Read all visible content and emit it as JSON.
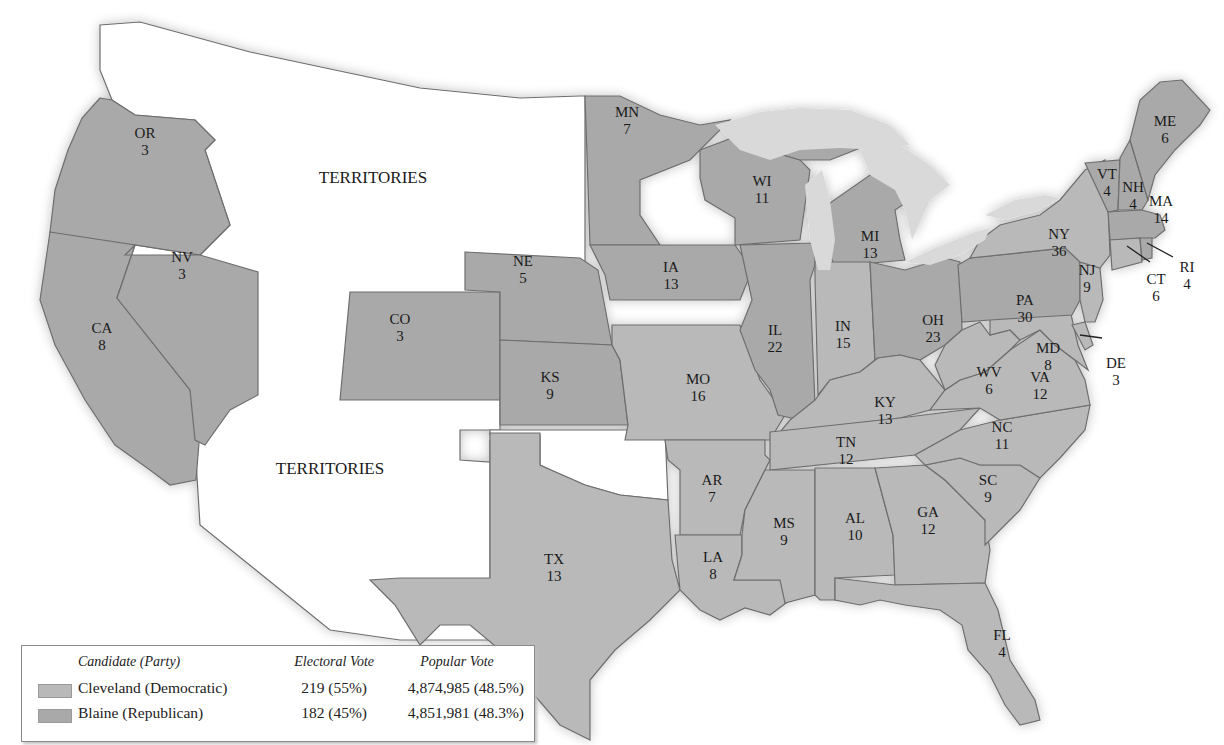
{
  "map": {
    "title": "Election of 1884",
    "territory_labels": [
      "TERRITORIES",
      "TERRITORIES"
    ],
    "colors": {
      "democratic": "#b9b9b9",
      "republican": "#a9a9a9",
      "territory": "#ffffff",
      "lakes": "#d9d9d9",
      "border": "#6e6e6e"
    },
    "states": [
      {
        "abbr": "OR",
        "ev": "3",
        "party": "republican"
      },
      {
        "abbr": "CA",
        "ev": "8",
        "party": "republican"
      },
      {
        "abbr": "NV",
        "ev": "3",
        "party": "republican"
      },
      {
        "abbr": "CO",
        "ev": "3",
        "party": "republican"
      },
      {
        "abbr": "NE",
        "ev": "5",
        "party": "republican"
      },
      {
        "abbr": "KS",
        "ev": "9",
        "party": "republican"
      },
      {
        "abbr": "MN",
        "ev": "7",
        "party": "republican"
      },
      {
        "abbr": "IA",
        "ev": "13",
        "party": "republican"
      },
      {
        "abbr": "MO",
        "ev": "16",
        "party": "democratic"
      },
      {
        "abbr": "TX",
        "ev": "13",
        "party": "democratic"
      },
      {
        "abbr": "AR",
        "ev": "7",
        "party": "democratic"
      },
      {
        "abbr": "LA",
        "ev": "8",
        "party": "democratic"
      },
      {
        "abbr": "WI",
        "ev": "11",
        "party": "republican"
      },
      {
        "abbr": "IL",
        "ev": "22",
        "party": "republican"
      },
      {
        "abbr": "MI",
        "ev": "13",
        "party": "republican"
      },
      {
        "abbr": "IN",
        "ev": "15",
        "party": "democratic"
      },
      {
        "abbr": "OH",
        "ev": "23",
        "party": "republican"
      },
      {
        "abbr": "KY",
        "ev": "13",
        "party": "democratic"
      },
      {
        "abbr": "TN",
        "ev": "12",
        "party": "democratic"
      },
      {
        "abbr": "MS",
        "ev": "9",
        "party": "democratic"
      },
      {
        "abbr": "AL",
        "ev": "10",
        "party": "democratic"
      },
      {
        "abbr": "GA",
        "ev": "12",
        "party": "democratic"
      },
      {
        "abbr": "FL",
        "ev": "4",
        "party": "democratic"
      },
      {
        "abbr": "SC",
        "ev": "9",
        "party": "democratic"
      },
      {
        "abbr": "NC",
        "ev": "11",
        "party": "democratic"
      },
      {
        "abbr": "VA",
        "ev": "12",
        "party": "democratic"
      },
      {
        "abbr": "WV",
        "ev": "6",
        "party": "democratic"
      },
      {
        "abbr": "MD",
        "ev": "8",
        "party": "democratic"
      },
      {
        "abbr": "DE",
        "ev": "3",
        "party": "democratic"
      },
      {
        "abbr": "PA",
        "ev": "30",
        "party": "republican"
      },
      {
        "abbr": "NJ",
        "ev": "9",
        "party": "democratic"
      },
      {
        "abbr": "NY",
        "ev": "36",
        "party": "democratic"
      },
      {
        "abbr": "CT",
        "ev": "6",
        "party": "democratic"
      },
      {
        "abbr": "RI",
        "ev": "4",
        "party": "republican"
      },
      {
        "abbr": "MA",
        "ev": "14",
        "party": "republican"
      },
      {
        "abbr": "VT",
        "ev": "4",
        "party": "republican"
      },
      {
        "abbr": "NH",
        "ev": "4",
        "party": "republican"
      },
      {
        "abbr": "ME",
        "ev": "6",
        "party": "republican"
      }
    ]
  },
  "legend": {
    "headers": {
      "candidate": "Candidate (Party)",
      "electoral": "Electoral Vote",
      "popular": "Popular Vote"
    },
    "rows": [
      {
        "candidate": "Cleveland (Democratic)",
        "electoral": "219 (55%)",
        "popular": "4,874,985 (48.5%)",
        "swatch": "#b9b9b9"
      },
      {
        "candidate": "Blaine (Republican)",
        "electoral": "182 (45%)",
        "popular": "4,851,981 (48.3%)",
        "swatch": "#a9a9a9"
      }
    ]
  }
}
